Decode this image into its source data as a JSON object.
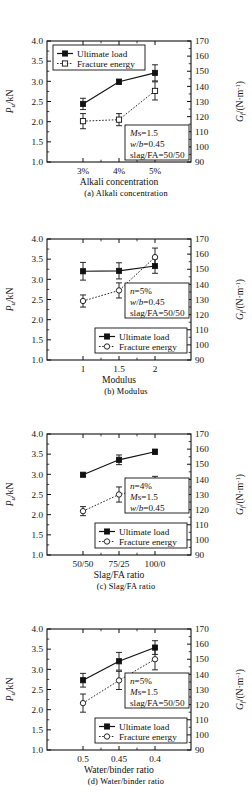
{
  "topbar": {
    "faint_text": ""
  },
  "axes": {
    "left_label": "P",
    "left_label_sub": "u",
    "left_label_unit": "/kN",
    "right_label": "G",
    "right_label_sub": "f",
    "right_label_unit": "/(N·m",
    "right_label_exp": "-1",
    "right_label_close": ")",
    "left_ticks": [
      "1.0",
      "1.5",
      "2.0",
      "2.5",
      "3.0",
      "3.5",
      "4.0"
    ],
    "right_ticks": [
      "90",
      "100",
      "110",
      "120",
      "130",
      "140",
      "150",
      "160",
      "170"
    ],
    "left_min": 1.0,
    "left_max": 4.0,
    "right_min": 90,
    "right_max": 170
  },
  "legend": {
    "ultimate_load": "Ultimate load",
    "fracture_energy": "Fracture energy"
  },
  "chart_data": [
    {
      "id": "a",
      "type": "line",
      "title": "",
      "caption": "(a)  Alkali concentration",
      "xlabel": "Alkali concentration",
      "ylabel": "P_u/kN",
      "y2label": "G_f/(N·m^-1)",
      "categories": [
        "3%",
        "4%",
        "5%"
      ],
      "ylim": [
        1.0,
        4.0
      ],
      "y2lim": [
        90,
        170
      ],
      "legend_position": "top-left",
      "annotation": [
        "Ms=1.5",
        "w/b=0.45",
        "slag/FA=50/50"
      ],
      "annotation_position": "bottom-right",
      "series": [
        {
          "name": "Ultimate load",
          "axis": "left",
          "marker": "filled-square",
          "line": "solid",
          "values": [
            2.44,
            2.99,
            3.21
          ],
          "errors": [
            0.14,
            0.06,
            0.2
          ]
        },
        {
          "name": "Fracture energy",
          "axis": "right",
          "marker": "open-square",
          "line": "dotted",
          "values": [
            117,
            118,
            137
          ],
          "errors": [
            5,
            4,
            6
          ]
        }
      ]
    },
    {
      "id": "b",
      "type": "line",
      "title": "",
      "caption": "(b)  Modulus",
      "xlabel": "Modulus",
      "ylabel": "P_u/kN",
      "y2label": "G_f/(N·m^-1)",
      "categories": [
        "1",
        "1.5",
        "2"
      ],
      "ylim": [
        1.0,
        4.0
      ],
      "y2lim": [
        90,
        170
      ],
      "legend_position": "bottom-center",
      "annotation": [
        "n=5%",
        "w/b=0.45",
        "slag/FA=50/50"
      ],
      "annotation_position": "middle-right",
      "series": [
        {
          "name": "Ultimate load",
          "axis": "left",
          "marker": "filled-square",
          "line": "solid",
          "values": [
            3.2,
            3.21,
            3.33
          ],
          "errors": [
            0.22,
            0.2,
            0.18
          ]
        },
        {
          "name": "Fracture energy",
          "axis": "right",
          "marker": "open-circle",
          "line": "dotted",
          "values": [
            129,
            136,
            158
          ],
          "errors": [
            4,
            5,
            6
          ]
        }
      ]
    },
    {
      "id": "c",
      "type": "line",
      "title": "",
      "caption": "(c)  Slag/FA ratio",
      "xlabel": "Slag/FA ratio",
      "ylabel": "P_u/kN",
      "y2label": "G_f/(N·m^-1)",
      "categories": [
        "50/50",
        "75/25",
        "100/0"
      ],
      "ylim": [
        1.0,
        4.0
      ],
      "y2lim": [
        90,
        170
      ],
      "legend_position": "bottom-center",
      "annotation": [
        "n=4%",
        "Ms=1.5",
        "w/b=0.45"
      ],
      "annotation_position": "middle-right",
      "series": [
        {
          "name": "Ultimate load",
          "axis": "left",
          "marker": "filled-square",
          "line": "solid",
          "values": [
            2.99,
            3.36,
            3.56
          ],
          "errors": [
            0.04,
            0.12,
            0.06
          ]
        },
        {
          "name": "Fracture energy",
          "axis": "right",
          "marker": "open-circle",
          "line": "dotted",
          "values": [
            119,
            130,
            135
          ],
          "errors": [
            3,
            5,
            7
          ]
        }
      ]
    },
    {
      "id": "d",
      "type": "line",
      "title": "",
      "caption": "(d)  Water/binder ratio",
      "xlabel": "Water/binder ratio",
      "ylabel": "P_u/kN",
      "y2label": "G_f/(N·m^-1)",
      "categories": [
        "0.5",
        "0.45",
        "0.4"
      ],
      "ylim": [
        1.0,
        4.0
      ],
      "y2lim": [
        90,
        170
      ],
      "legend_position": "bottom-center",
      "annotation": [
        "n=5%",
        "Ms=1.5",
        "slag/FA=50/50"
      ],
      "annotation_position": "middle-right",
      "series": [
        {
          "name": "Ultimate load",
          "axis": "left",
          "marker": "filled-square",
          "line": "solid",
          "values": [
            2.73,
            3.2,
            3.54
          ],
          "errors": [
            0.17,
            0.22,
            0.17
          ]
        },
        {
          "name": "Fracture energy",
          "axis": "right",
          "marker": "open-circle",
          "line": "dotted",
          "values": [
            121,
            136,
            150
          ],
          "errors": [
            6,
            6,
            7
          ]
        }
      ]
    }
  ]
}
